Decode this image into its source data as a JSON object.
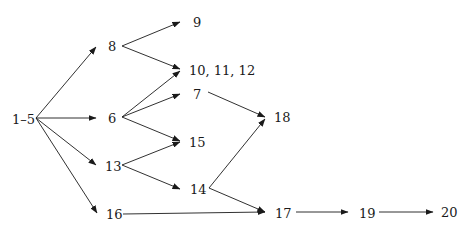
{
  "diagram": {
    "type": "precedence-network",
    "nodes": [
      {
        "id": "n1_5",
        "label": "1–5",
        "x": 12,
        "y": 119
      },
      {
        "id": "n8",
        "label": "8",
        "x": 108,
        "y": 46
      },
      {
        "id": "n9",
        "label": "9",
        "x": 193,
        "y": 22
      },
      {
        "id": "n10_12",
        "label": "10, 11, 12",
        "x": 189,
        "y": 70
      },
      {
        "id": "n7",
        "label": "7",
        "x": 193,
        "y": 94
      },
      {
        "id": "n6",
        "label": "6",
        "x": 108,
        "y": 118
      },
      {
        "id": "n15",
        "label": "15",
        "x": 189,
        "y": 142
      },
      {
        "id": "n13",
        "label": "13",
        "x": 105,
        "y": 166
      },
      {
        "id": "n14",
        "label": "14",
        "x": 190,
        "y": 189
      },
      {
        "id": "n16",
        "label": "16",
        "x": 106,
        "y": 214
      },
      {
        "id": "n18",
        "label": "18",
        "x": 274,
        "y": 117
      },
      {
        "id": "n17",
        "label": "17",
        "x": 275,
        "y": 213
      },
      {
        "id": "n19",
        "label": "19",
        "x": 359,
        "y": 213
      },
      {
        "id": "n20",
        "label": "20",
        "x": 441,
        "y": 212
      }
    ],
    "edges": [
      {
        "from": "1–5",
        "to": "8",
        "x1": 36,
        "y1": 118,
        "x2": 96,
        "y2": 47
      },
      {
        "from": "1–5",
        "to": "6",
        "x1": 36,
        "y1": 118,
        "x2": 96,
        "y2": 118
      },
      {
        "from": "1–5",
        "to": "13",
        "x1": 36,
        "y1": 118,
        "x2": 96,
        "y2": 165
      },
      {
        "from": "1–5",
        "to": "16",
        "x1": 36,
        "y1": 118,
        "x2": 97,
        "y2": 213
      },
      {
        "from": "8",
        "to": "9",
        "x1": 122,
        "y1": 46,
        "x2": 180,
        "y2": 22
      },
      {
        "from": "8",
        "to": "10, 11, 12",
        "x1": 122,
        "y1": 46,
        "x2": 180,
        "y2": 69
      },
      {
        "from": "6",
        "to": "10, 11, 12",
        "x1": 122,
        "y1": 117,
        "x2": 180,
        "y2": 71
      },
      {
        "from": "6",
        "to": "7",
        "x1": 122,
        "y1": 117,
        "x2": 180,
        "y2": 94
      },
      {
        "from": "6",
        "to": "15",
        "x1": 122,
        "y1": 117,
        "x2": 180,
        "y2": 141
      },
      {
        "from": "13",
        "to": "15",
        "x1": 122,
        "y1": 165,
        "x2": 180,
        "y2": 142
      },
      {
        "from": "13",
        "to": "14",
        "x1": 122,
        "y1": 165,
        "x2": 180,
        "y2": 189
      },
      {
        "from": "7",
        "to": "18",
        "x1": 208,
        "y1": 92,
        "x2": 265,
        "y2": 117
      },
      {
        "from": "14",
        "to": "18",
        "x1": 209,
        "y1": 188,
        "x2": 265,
        "y2": 119
      },
      {
        "from": "14",
        "to": "17",
        "x1": 209,
        "y1": 188,
        "x2": 265,
        "y2": 212
      },
      {
        "from": "16",
        "to": "17",
        "x1": 123,
        "y1": 214,
        "x2": 265,
        "y2": 212
      },
      {
        "from": "17",
        "to": "19",
        "x1": 296,
        "y1": 212,
        "x2": 348,
        "y2": 212
      },
      {
        "from": "19",
        "to": "20",
        "x1": 379,
        "y1": 212,
        "x2": 433,
        "y2": 212
      }
    ]
  }
}
